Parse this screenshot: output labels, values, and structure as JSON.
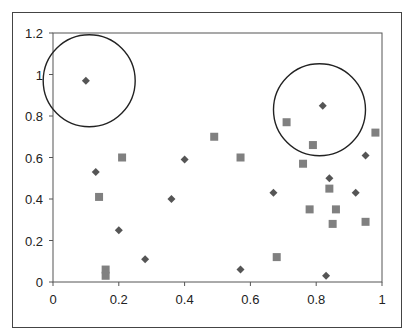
{
  "chart_data": {
    "type": "scatter",
    "title": "",
    "xlabel": "",
    "ylabel": "",
    "xlim": [
      0,
      1
    ],
    "ylim": [
      0,
      1.2
    ],
    "x_ticks": [
      "0",
      "0.2",
      "0.4",
      "0.6",
      "0.8",
      "1"
    ],
    "y_ticks": [
      "0",
      "0.2",
      "0.4",
      "0.6",
      "0.8",
      "1",
      "1.2"
    ],
    "grid": false,
    "legend": null,
    "series": [
      {
        "name": "diamonds",
        "marker": "diamond",
        "color": "#555555",
        "points": [
          [
            0.1,
            0.97
          ],
          [
            0.13,
            0.53
          ],
          [
            0.2,
            0.25
          ],
          [
            0.28,
            0.11
          ],
          [
            0.36,
            0.4
          ],
          [
            0.4,
            0.59
          ],
          [
            0.57,
            0.06
          ],
          [
            0.67,
            0.43
          ],
          [
            0.82,
            0.85
          ],
          [
            0.84,
            0.5
          ],
          [
            0.92,
            0.43
          ],
          [
            0.95,
            0.61
          ],
          [
            0.83,
            0.03
          ]
        ]
      },
      {
        "name": "squares",
        "marker": "square",
        "color": "#808080",
        "points": [
          [
            0.21,
            0.6
          ],
          [
            0.14,
            0.41
          ],
          [
            0.16,
            0.06
          ],
          [
            0.16,
            0.03
          ],
          [
            0.49,
            0.7
          ],
          [
            0.57,
            0.6
          ],
          [
            0.68,
            0.12
          ],
          [
            0.71,
            0.77
          ],
          [
            0.76,
            0.57
          ],
          [
            0.79,
            0.66
          ],
          [
            0.78,
            0.35
          ],
          [
            0.84,
            0.45
          ],
          [
            0.86,
            0.35
          ],
          [
            0.85,
            0.28
          ],
          [
            0.95,
            0.29
          ],
          [
            0.98,
            0.72
          ]
        ]
      }
    ],
    "annotations": [
      {
        "type": "circle",
        "center": [
          0.11,
          0.97
        ],
        "radius_px": 46,
        "label": "outlier circle left"
      },
      {
        "type": "circle",
        "center": [
          0.81,
          0.83
        ],
        "radius_px": 46,
        "label": "outlier circle right"
      }
    ]
  }
}
